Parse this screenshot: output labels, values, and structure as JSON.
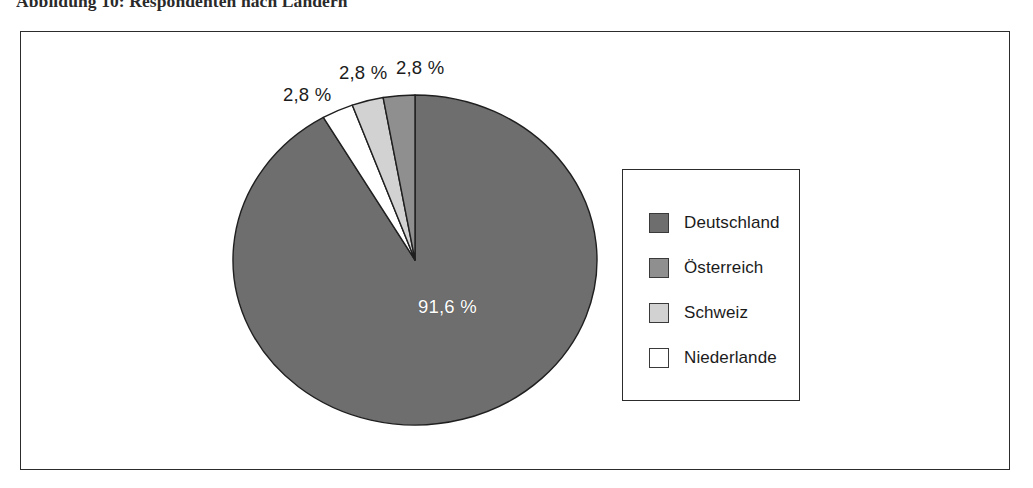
{
  "caption": {
    "text": "Abbildung 10: Respondenten nach Ländern"
  },
  "legend": {
    "items": [
      {
        "label": "Deutschland",
        "color": "#6e6e6e"
      },
      {
        "label": "Österreich",
        "color": "#8f8f8f"
      },
      {
        "label": "Schweiz",
        "color": "#d2d2d2"
      },
      {
        "label": "Niederlande",
        "color": "#ffffff"
      }
    ]
  },
  "labels": {
    "oesterreich_pct": "2,8 %",
    "schweiz_pct": "2,8 %",
    "niederlande_pct": "2,8 %",
    "deutschland_pct": "91,6 %"
  },
  "chart_data": {
    "type": "pie",
    "title": "Abbildung 10: Respondenten nach Ländern",
    "xlabel": "",
    "ylabel": "",
    "legend_position": "right",
    "grid": false,
    "start_angle_deg": 90,
    "direction": "clockwise",
    "categories": [
      "Deutschland",
      "Österreich",
      "Schweiz",
      "Niederlande"
    ],
    "values": [
      91.6,
      2.8,
      2.8,
      2.8
    ],
    "value_labels": [
      "91,6 %",
      "2,8 %",
      "2,8 %",
      "2,8 %"
    ],
    "colors": [
      "#6e6e6e",
      "#8f8f8f",
      "#d2d2d2",
      "#ffffff"
    ],
    "slice_order_clockwise_from_top": [
      "Deutschland",
      "Niederlande",
      "Schweiz",
      "Österreich"
    ],
    "units": "percent",
    "total": 100.0
  },
  "geometry": {
    "center_x": 415,
    "center_y": 260,
    "radius_x": 182,
    "radius_y": 165,
    "stroke": "#1f1f1f"
  }
}
